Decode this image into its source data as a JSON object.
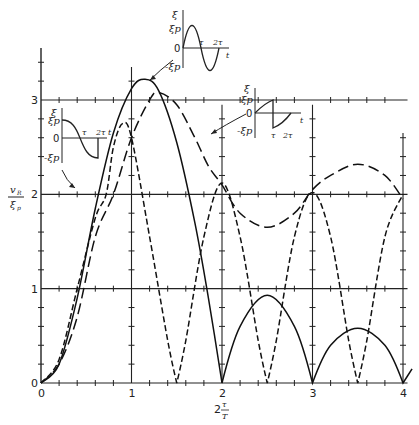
{
  "chart_data": {
    "type": "line",
    "title": "",
    "xlabel": "2 τ/T",
    "ylabel": "v_R / ξ_p",
    "xlim": [
      0,
      4
    ],
    "ylim": [
      0,
      3.6
    ],
    "x_ticks": [
      "0",
      "1",
      "2",
      "3",
      "4"
    ],
    "y_ticks": [
      "0",
      "1",
      "2",
      "3"
    ],
    "grid": "major lines at integer values with minor tick marks every 0.2",
    "series": [
      {
        "name": "sine pulse (one full period, duration 2τ)",
        "style": "solid",
        "points": [
          [
            0,
            0
          ],
          [
            0.2,
            0.2
          ],
          [
            0.4,
            0.9
          ],
          [
            0.6,
            1.85
          ],
          [
            0.8,
            2.65
          ],
          [
            1.0,
            3.12
          ],
          [
            1.15,
            3.22
          ],
          [
            1.3,
            3.1
          ],
          [
            1.5,
            2.55
          ],
          [
            1.7,
            1.7
          ],
          [
            1.85,
            0.9
          ],
          [
            2.0,
            0
          ],
          [
            2.2,
            0.6
          ],
          [
            2.5,
            0.93
          ],
          [
            2.8,
            0.6
          ],
          [
            3.0,
            0
          ],
          [
            3.2,
            0.4
          ],
          [
            3.5,
            0.58
          ],
          [
            3.8,
            0.4
          ],
          [
            4.0,
            0
          ],
          [
            4.1,
            0.15
          ]
        ]
      },
      {
        "name": "cosine half-wave pulse",
        "style": "short-dash",
        "points": [
          [
            0,
            0
          ],
          [
            0.2,
            0.25
          ],
          [
            0.4,
            1.0
          ],
          [
            0.6,
            1.75
          ],
          [
            0.72,
            2.0
          ],
          [
            0.8,
            2.5
          ],
          [
            0.9,
            2.75
          ],
          [
            1.0,
            2.6
          ],
          [
            1.2,
            1.55
          ],
          [
            1.4,
            0.45
          ],
          [
            1.5,
            0
          ],
          [
            1.6,
            0.45
          ],
          [
            1.8,
            1.55
          ],
          [
            2.0,
            2.12
          ],
          [
            2.2,
            1.55
          ],
          [
            2.4,
            0.45
          ],
          [
            2.5,
            0
          ],
          [
            2.6,
            0.45
          ],
          [
            2.8,
            1.55
          ],
          [
            3.0,
            2.02
          ],
          [
            3.2,
            1.55
          ],
          [
            3.4,
            0.45
          ],
          [
            3.5,
            0
          ],
          [
            3.6,
            0.45
          ],
          [
            3.8,
            1.55
          ],
          [
            4.0,
            2.0
          ]
        ]
      },
      {
        "name": "sawtooth-like pulse",
        "style": "long-dash",
        "points": [
          [
            0,
            0
          ],
          [
            0.2,
            0.2
          ],
          [
            0.4,
            0.7
          ],
          [
            0.6,
            1.55
          ],
          [
            0.8,
            2.0
          ],
          [
            1.0,
            2.6
          ],
          [
            1.2,
            3.0
          ],
          [
            1.3,
            3.08
          ],
          [
            1.5,
            2.95
          ],
          [
            1.7,
            2.6
          ],
          [
            1.85,
            2.3
          ],
          [
            2.0,
            2.1
          ],
          [
            2.2,
            1.8
          ],
          [
            2.5,
            1.65
          ],
          [
            2.8,
            1.8
          ],
          [
            3.0,
            2.05
          ],
          [
            3.2,
            2.2
          ],
          [
            3.5,
            2.32
          ],
          [
            3.8,
            2.2
          ],
          [
            4.0,
            1.95
          ]
        ]
      }
    ],
    "annotations": [
      {
        "type": "inset",
        "label": "sine pulse waveform",
        "axis_labels": [
          "ξ",
          "ξp",
          "0",
          "-ξp",
          "τ",
          "2τ",
          "t"
        ],
        "arrow_to": "solid peak"
      },
      {
        "type": "inset",
        "label": "cosine half-wave waveform",
        "axis_labels": [
          "ξ",
          "ξp",
          "0",
          "-ξp",
          "τ",
          "2τ",
          "t"
        ],
        "arrow_to": "short-dash curve near (0.72, 2)"
      },
      {
        "type": "inset",
        "label": "sawtooth waveform",
        "axis_labels": [
          "ξ",
          "ξp",
          "0",
          "-ξp",
          "τ",
          "2τ",
          "t"
        ],
        "arrow_to": "long-dash curve near (1.75, 2.45)"
      }
    ]
  },
  "labels": {
    "y_axis_num": "v",
    "y_axis_num_sub": "R",
    "y_axis_den": "ξ",
    "y_axis_den_sub": "p",
    "x_axis_prefix": "2",
    "x_axis_num": "τ",
    "x_axis_den": "T",
    "origin": "0",
    "inset": {
      "xi": "ξ",
      "xip": "ξp",
      "zero": "0",
      "neg_xip": "-ξp",
      "tau": "τ",
      "two_tau": "2τ",
      "t": "t"
    }
  }
}
